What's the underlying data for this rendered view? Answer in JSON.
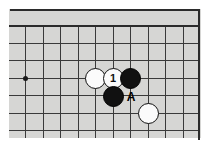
{
  "figure": {
    "kind": "go-board-diagram",
    "title": "",
    "board_colors": {
      "background": "#d6d6d4",
      "grid_line": "#3a3a3a",
      "edge_line": "#2b2b2b",
      "black_stone": "#111111",
      "white_stone": "#fbfbfb",
      "label_text": "#000000",
      "page": "#ffffff"
    }
  },
  "board": {
    "origin_x": 7,
    "origin_y": 25,
    "cell": 17.5,
    "columns": 11,
    "rows": 7,
    "top_edge_y": 25,
    "right_edge_x": 198,
    "vertical_lines_x": [
      7,
      25,
      43,
      60,
      78,
      95,
      113,
      130,
      148,
      165,
      183
    ],
    "horizontal_lines_y": [
      25,
      43,
      60,
      78,
      95,
      113,
      130
    ],
    "star_points": [
      {
        "name": "hoshi-left",
        "x": 25,
        "y": 78
      }
    ]
  },
  "stones": [
    {
      "id": "white-stone-left",
      "color": "white",
      "label": "",
      "x": 95,
      "y": 78
    },
    {
      "id": "white-stone-move1",
      "color": "white",
      "label": "1",
      "x": 113,
      "y": 78
    },
    {
      "id": "black-stone-right",
      "color": "black",
      "label": "",
      "x": 130,
      "y": 78
    },
    {
      "id": "black-stone-below",
      "color": "black",
      "label": "",
      "x": 113,
      "y": 96
    },
    {
      "id": "white-stone-low",
      "color": "white",
      "label": "",
      "x": 148,
      "y": 113
    }
  ],
  "markers": [
    {
      "id": "point-a",
      "label": "A",
      "x": 131,
      "y": 97
    }
  ]
}
